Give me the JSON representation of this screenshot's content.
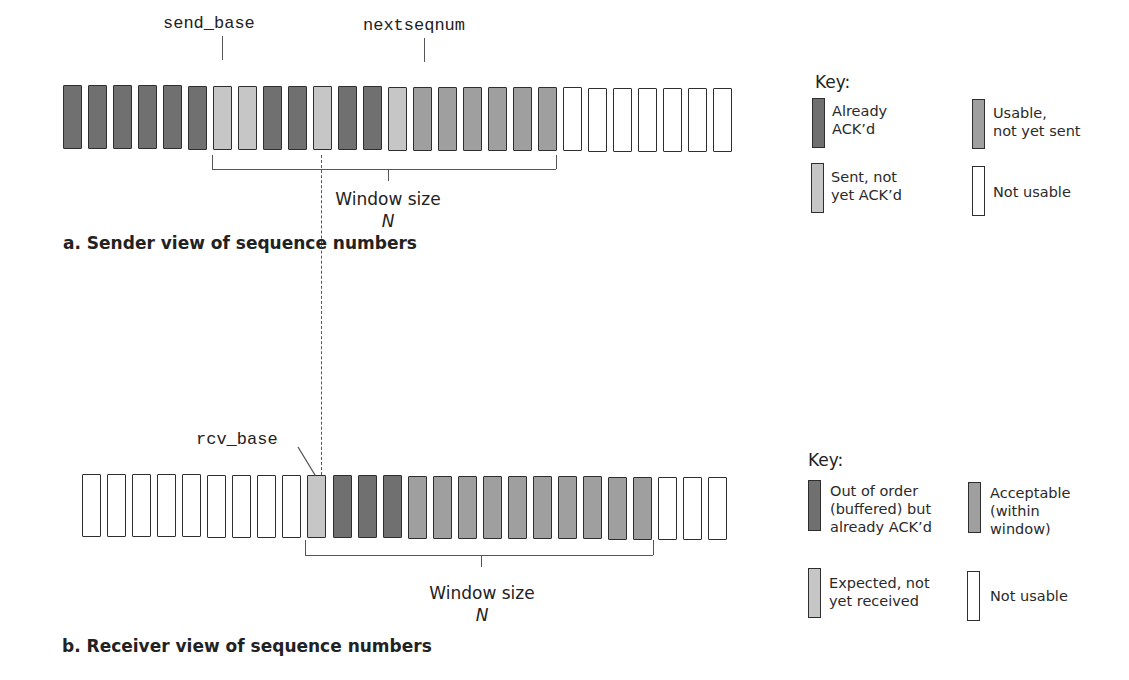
{
  "sender": {
    "labels": {
      "send_base": "send_base",
      "nextseqnum": "nextseqnum"
    },
    "window_label": "Window size",
    "window_symbol": "N",
    "caption": "a. Sender view of sequence numbers",
    "boxes": [
      "D",
      "D",
      "D",
      "D",
      "D",
      "D",
      "L",
      "L",
      "D",
      "D",
      "L",
      "D",
      "D",
      "L",
      "M",
      "M",
      "M",
      "M",
      "M",
      "M",
      "W",
      "W",
      "W",
      "W",
      "W",
      "W",
      "W"
    ],
    "send_base_index": 6,
    "nextseqnum_index": 14,
    "window_start_index": 6,
    "window_end_index": 19,
    "key": {
      "title": "Key:",
      "items": [
        {
          "type": "D",
          "label_lines": [
            "Already",
            "ACK’d"
          ]
        },
        {
          "type": "M",
          "label_lines": [
            "Usable,",
            "not yet sent"
          ]
        },
        {
          "type": "L",
          "label_lines": [
            "Sent, not",
            "yet ACK’d"
          ]
        },
        {
          "type": "W",
          "label_lines": [
            "Not usable"
          ]
        }
      ]
    }
  },
  "receiver": {
    "labels": {
      "rcv_base": "rcv_base"
    },
    "window_label": "Window size",
    "window_symbol": "N",
    "caption": "b. Receiver view of sequence numbers",
    "boxes": [
      "W",
      "W",
      "W",
      "W",
      "W",
      "W",
      "W",
      "W",
      "W",
      "L",
      "D",
      "D",
      "D",
      "M",
      "M",
      "M",
      "M",
      "M",
      "M",
      "M",
      "M",
      "M",
      "M",
      "W",
      "W",
      "W"
    ],
    "rcv_base_index": 9,
    "window_start_index": 9,
    "window_end_index": 22,
    "key": {
      "title": "Key:",
      "items": [
        {
          "type": "D",
          "label_lines": [
            "Out of order",
            "(buffered) but",
            "already ACK’d"
          ]
        },
        {
          "type": "M",
          "label_lines": [
            "Acceptable",
            "(within",
            "window)"
          ]
        },
        {
          "type": "L",
          "label_lines": [
            "Expected, not",
            "yet received"
          ]
        },
        {
          "type": "W",
          "label_lines": [
            "Not usable"
          ]
        }
      ]
    }
  },
  "colors": {
    "already_acked": "#707070",
    "usable": "#9f9f9f",
    "sent_not_acked": "#c6c6c6",
    "not_usable": "#ffffff",
    "border": "#2e2e2e"
  }
}
